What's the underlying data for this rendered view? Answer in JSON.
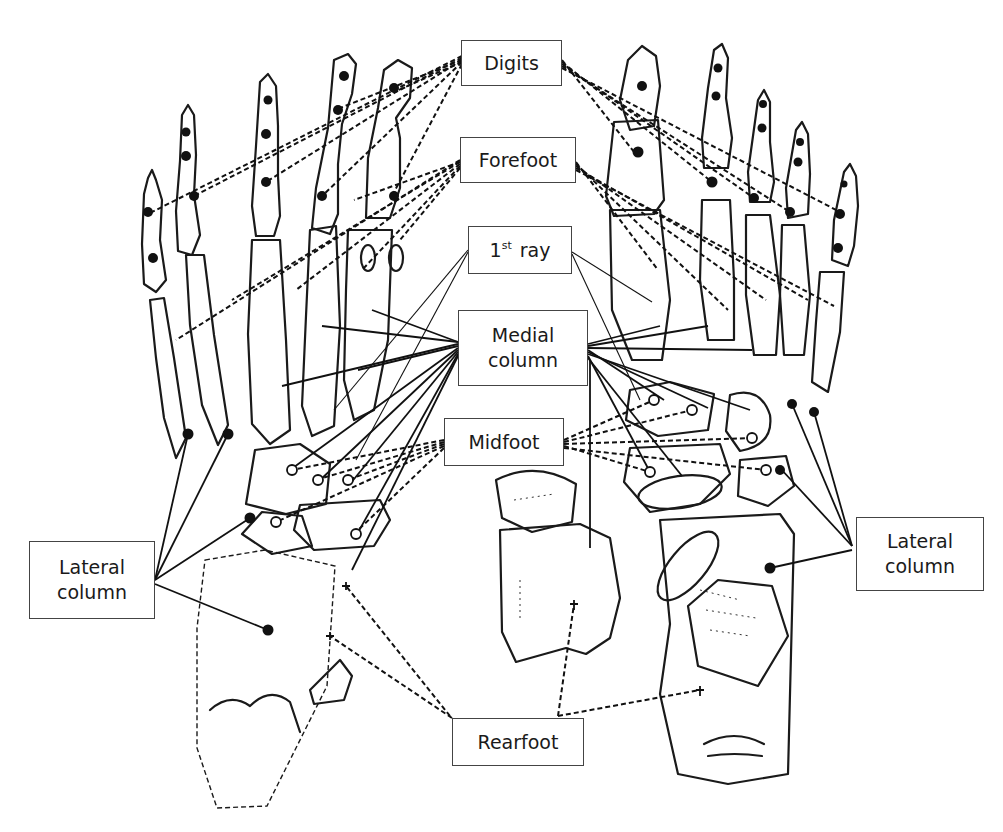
{
  "figure": {
    "labels": {
      "digits": "Digits",
      "forefoot": "Forefoot",
      "first_ray_number": "1",
      "first_ray_suffix": "st",
      "first_ray_word": "ray",
      "medial_column_line1": "Medial",
      "medial_column_line2": "column",
      "midfoot": "Midfoot",
      "lateral_column_left_line1": "Lateral",
      "lateral_column_left_line2": "column",
      "lateral_column_right_line1": "Lateral",
      "lateral_column_right_line2": "column",
      "rearfoot": "Rearfoot"
    },
    "marker_legend": {
      "filled_dot": "segment marker",
      "open_circle": "midfoot marker",
      "cross": "rearfoot marker"
    }
  }
}
